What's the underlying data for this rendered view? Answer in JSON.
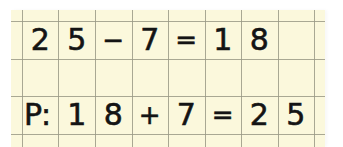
{
  "colors": {
    "paper": "#fbf8dc",
    "grid": "#9a9a86",
    "ink": "#141414",
    "background": "#ffffff"
  },
  "grid": {
    "column_lines_x": [
      11,
      47,
      84,
      121,
      157,
      194,
      230,
      267,
      303
    ],
    "row_lines_y": [
      11,
      49,
      86,
      124
    ]
  },
  "rows": [
    {
      "id": "subtraction",
      "cells": [
        "2",
        "5",
        "−",
        "7",
        "=",
        "1",
        "8",
        ""
      ]
    },
    {
      "id": "check",
      "cells": [
        "P:",
        "1",
        "8",
        "+",
        "7",
        "=",
        "2",
        "5"
      ]
    }
  ],
  "equations": {
    "subtraction": "25 − 7 = 18",
    "check": "P: 18 + 7 = 25"
  }
}
